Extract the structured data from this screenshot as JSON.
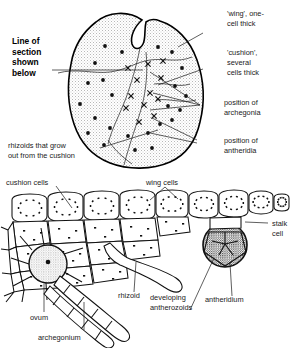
{
  "figure": {
    "upper_view": "surface view of heart-shaped prothallus",
    "lower_view": "vertical section through prothallus"
  },
  "labels": {
    "line_of_section": "Line of\nsection\nshown\nbelow",
    "line_of_section_lines": [
      "Line of",
      "section",
      "shown",
      "below"
    ],
    "wing": "'wing', one-\ncell thick",
    "wing_lines": [
      "'wing', one-",
      "cell thick"
    ],
    "cushion": "'cushion',\nseveral\ncells thick",
    "cushion_lines": [
      "'cushion',",
      "several",
      "cells thick"
    ],
    "archegonia": "position of\narchegonia",
    "archegonia_lines": [
      "position of",
      "archegonia"
    ],
    "antheridia": "position of\nantheridia",
    "antheridia_lines": [
      "position of",
      "antheridia"
    ],
    "rhizoids": "rhizoids that grow\nout from the cushion",
    "rhizoids_lines": [
      "rhizoids that grow",
      "out from the cushion"
    ],
    "cushion_cells": "cushion cells",
    "wing_cells": "wing cells",
    "stalk_cell": "stalk\ncell",
    "stalk_cell_lines": [
      "stalk",
      "cell"
    ],
    "antheridium": "antheridium",
    "developing_antherozoids": "developing\nantherozoids",
    "developing_antherozoids_lines": [
      "developing",
      "antherozoids"
    ],
    "rhizoid": "rhizoid",
    "ovum": "ovum",
    "archegonium": "archegonium"
  },
  "colors": {
    "ink": "#111111",
    "outline": "#000000",
    "background": "#ffffff",
    "stipple": "#9a9a9a",
    "antheridium_fill": "#3a3a3a"
  },
  "markers": {
    "archegonia_symbol": "x",
    "antheridia_symbol": "dot",
    "archegonia_positions": [
      [
        128,
        68
      ],
      [
        148,
        64
      ],
      [
        161,
        78
      ],
      [
        137,
        80
      ],
      [
        150,
        93
      ],
      [
        144,
        105
      ],
      [
        158,
        99
      ],
      [
        131,
        96
      ],
      [
        154,
        116
      ],
      [
        139,
        122
      ],
      [
        126,
        108
      ],
      [
        163,
        61
      ]
    ],
    "antheridia_positions": [
      [
        105,
        46
      ],
      [
        122,
        52
      ],
      [
        95,
        63
      ],
      [
        158,
        47
      ],
      [
        172,
        52
      ],
      [
        182,
        68
      ],
      [
        88,
        83
      ],
      [
        103,
        80
      ],
      [
        112,
        95
      ],
      [
        80,
        104
      ],
      [
        95,
        118
      ],
      [
        175,
        86
      ],
      [
        168,
        106
      ],
      [
        186,
        96
      ],
      [
        110,
        128
      ],
      [
        128,
        136
      ],
      [
        88,
        133
      ],
      [
        148,
        133
      ],
      [
        160,
        124
      ],
      [
        172,
        120
      ],
      [
        104,
        145
      ],
      [
        135,
        150
      ],
      [
        152,
        148
      ],
      [
        180,
        110
      ]
    ]
  }
}
